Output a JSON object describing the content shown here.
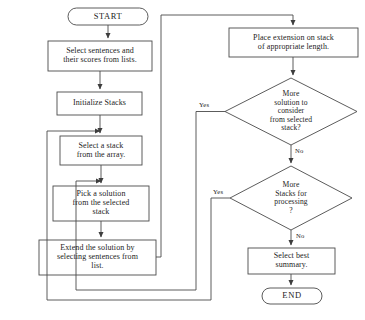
{
  "diagram": {
    "line_color": "#4a4a4a",
    "text_color": "#1c1c1c",
    "background": "#ffffff",
    "nodes": {
      "start": {
        "shape": "terminal",
        "label": "START"
      },
      "select_sentences": {
        "shape": "process",
        "label": "Select sentences and\ntheir scores from lists."
      },
      "initialize_stacks": {
        "shape": "process",
        "label": "Initialize Stacks"
      },
      "select_stack": {
        "shape": "process",
        "label": "Select a stack\nfrom the array."
      },
      "pick_solution": {
        "shape": "process",
        "label": "Pick a solution\nfrom the selected\nstack"
      },
      "extend_solution": {
        "shape": "process",
        "label": "Extend the solution by\nselecting sentences from\nlist."
      },
      "place_extension": {
        "shape": "process",
        "label": "Place extension on stack\nof appropriate length."
      },
      "more_solution": {
        "shape": "decision",
        "label": "More\nsolution to\nconsider\nfrom selected\nstack?"
      },
      "more_stacks": {
        "shape": "decision",
        "label": "More\nStacks for\nprocessing\n?"
      },
      "select_best": {
        "shape": "process",
        "label": "Select best\nsummary."
      },
      "end": {
        "shape": "terminal",
        "label": "END"
      }
    },
    "edge_labels": {
      "more_solution_yes": "Yes",
      "more_solution_no": "No",
      "more_stacks_yes": "Yes",
      "more_stacks_no": "No"
    }
  }
}
